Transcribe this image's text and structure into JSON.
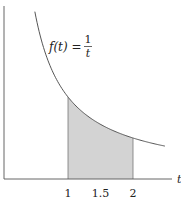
{
  "chart_data": {
    "type": "area",
    "title": "",
    "function_label": {
      "lhs": "f(t) =",
      "numerator": "1",
      "denominator": "t"
    },
    "function": "f(t) = 1/t",
    "xlabel": "t",
    "ylabel": "",
    "x_ticks": [
      {
        "value": 1,
        "label": "1"
      },
      {
        "value": 1.5,
        "label": "1.5"
      },
      {
        "value": 2,
        "label": "2"
      }
    ],
    "shaded_region": {
      "from": 1,
      "to": 2,
      "under": "f(t) = 1/t"
    },
    "curve_domain": [
      0.49,
      2.49
    ],
    "xlim": [
      0,
      2.6
    ],
    "ylim": [
      0,
      2.1
    ],
    "grid": false,
    "legend": null,
    "sample_points": [
      {
        "t": 0.5,
        "f": 2.0
      },
      {
        "t": 1.0,
        "f": 1.0
      },
      {
        "t": 1.5,
        "f": 0.667
      },
      {
        "t": 2.0,
        "f": 0.5
      },
      {
        "t": 2.5,
        "f": 0.4
      }
    ]
  },
  "colors": {
    "axis": "#555555",
    "curve": "#555555",
    "shade": "#d3d3d3",
    "text": "#222222"
  }
}
